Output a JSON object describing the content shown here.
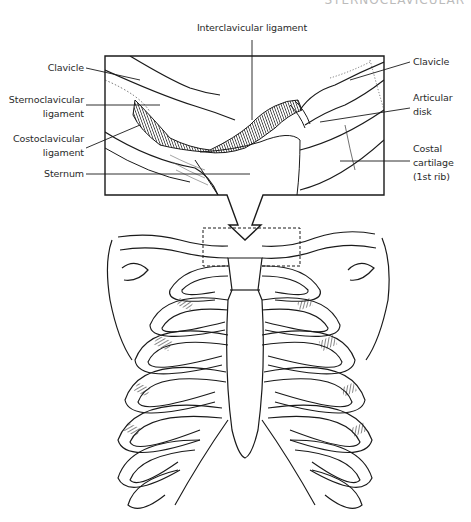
{
  "figure": {
    "header_cutoff_text": "STERNOCLAVICULAR",
    "labels": {
      "interclavicular": "Interclavicular ligament",
      "clavicle_left": "Clavicle",
      "sternoclavicular_1": "Sternoclavicular",
      "sternoclavicular_2": "ligament",
      "costoclavicular_1": "Costoclavicular",
      "costoclavicular_2": "ligament",
      "sternum": "Sternum",
      "clavicle_right": "Clavicle",
      "articular_1": "Articular",
      "articular_2": "disk",
      "costal_1": "Costal",
      "costal_2": "cartilage",
      "costal_3": "(1st rib)"
    },
    "colors": {
      "line": "#1a1a1a",
      "background": "#ffffff",
      "text": "#2a2a2a"
    }
  }
}
